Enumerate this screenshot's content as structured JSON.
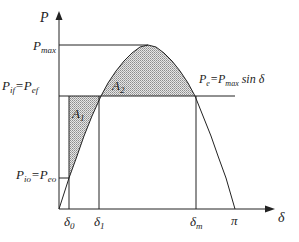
{
  "diagram": {
    "axes": {
      "y_label": "P",
      "x_label": "δ"
    },
    "curve_label": {
      "lhs": "P",
      "lhs_sub": "e",
      "eq": "=",
      "rhs": "P",
      "rhs_sub": "max",
      "rhs_tail": " sin δ"
    },
    "y_ticks": {
      "pmax": {
        "main": "P",
        "sub": "max"
      },
      "p_final": {
        "a": "P",
        "a_sub": "if",
        "eq": "=",
        "b": "P",
        "b_sub": "ef"
      },
      "p_initial": {
        "a": "P",
        "a_sub": "io",
        "eq": "=",
        "b": "P",
        "b_sub": "eo"
      }
    },
    "x_ticks": [
      {
        "main": "δ",
        "sub": "0"
      },
      {
        "main": "δ",
        "sub": "1"
      },
      {
        "main": "δ",
        "sub": "m"
      },
      {
        "main": "π",
        "sub": ""
      }
    ],
    "areas": [
      {
        "main": "A",
        "sub": "1"
      },
      {
        "main": "A",
        "sub": "2"
      }
    ],
    "colors": {
      "line": "#222222",
      "shade": "#bdbdbd"
    }
  }
}
